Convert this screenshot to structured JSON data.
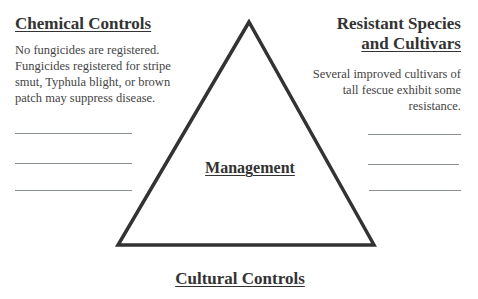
{
  "diagram": {
    "type": "triangle-management-model",
    "center_label": "Management",
    "chemical_controls": {
      "heading": "Chemical Controls",
      "text_lines": [
        "No fungicides are registered.",
        "Fungicides registered for stripe",
        "smut, Typhula blight, or brown",
        "patch may suppress disease."
      ],
      "blank_lines": 3
    },
    "resistant_species": {
      "heading_line1": "Resistant Species",
      "heading_line2": "and Cultivars",
      "text_lines": [
        "Several improved cultivars of",
        "tall fescue exhibit some",
        "resistance."
      ],
      "blank_lines": 3
    },
    "cultural_controls": {
      "heading": "Cultural Controls"
    },
    "colors": {
      "triangle_stroke": "#333333",
      "text": "#3a3a3a",
      "blank_line": "#8a8f8f"
    }
  }
}
